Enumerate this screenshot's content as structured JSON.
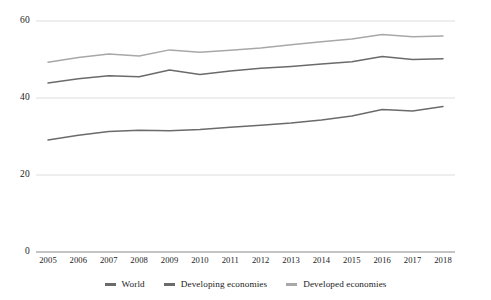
{
  "chart_data": {
    "type": "line",
    "title": "",
    "subtitle": "",
    "xlabel": "",
    "ylabel": "",
    "categories": [
      "2005",
      "2006",
      "2007",
      "2008",
      "2009",
      "2010",
      "2011",
      "2012",
      "2013",
      "2014",
      "2015",
      "2016",
      "2017",
      "2018"
    ],
    "x": [
      2005,
      2006,
      2007,
      2008,
      2009,
      2010,
      2011,
      2012,
      2013,
      2014,
      2015,
      2016,
      2017,
      2018
    ],
    "ylim": [
      0,
      62
    ],
    "yticks": [
      0,
      20,
      40,
      60
    ],
    "ytick_labels": [
      "0",
      "20",
      "40",
      "60"
    ],
    "grid": true,
    "legend_position": "bottom",
    "series": [
      {
        "name": "World",
        "color": "#6b6b6b",
        "values": [
          29.1,
          30.3,
          31.3,
          31.6,
          31.5,
          31.8,
          32.4,
          32.9,
          33.5,
          34.3,
          35.3,
          37.0,
          36.6,
          37.8
        ]
      },
      {
        "name": "Developing economies",
        "color": "#6b6b6b",
        "values": [
          43.9,
          45.0,
          45.8,
          45.5,
          47.3,
          46.1,
          47.0,
          47.7,
          48.2,
          48.8,
          49.4,
          50.8,
          50.0,
          50.2
        ]
      },
      {
        "name": "Developed economies",
        "color": "#a8a8a8",
        "values": [
          49.3,
          50.5,
          51.4,
          50.9,
          52.5,
          51.9,
          52.4,
          53.0,
          53.8,
          54.6,
          55.3,
          56.5,
          55.9,
          56.1
        ]
      }
    ]
  },
  "axis": {
    "ytick_labels": [
      "60",
      "40",
      "20",
      "0"
    ],
    "xtick_labels": [
      "2005",
      "2006",
      "2007",
      "2008",
      "2009",
      "2010",
      "2011",
      "2012",
      "2013",
      "2014",
      "2015",
      "2016",
      "2017",
      "2018"
    ]
  },
  "legend": {
    "items": [
      {
        "label": "World",
        "color": "#6b6b6b"
      },
      {
        "label": "Developing economies",
        "color": "#6b6b6b"
      },
      {
        "label": "Developed economies",
        "color": "#a8a8a8"
      }
    ]
  },
  "colors": {
    "gridline": "#d9d9d9",
    "axisline": "#8a8a8a",
    "background": "#ffffff",
    "text": "#1a1a1a"
  }
}
